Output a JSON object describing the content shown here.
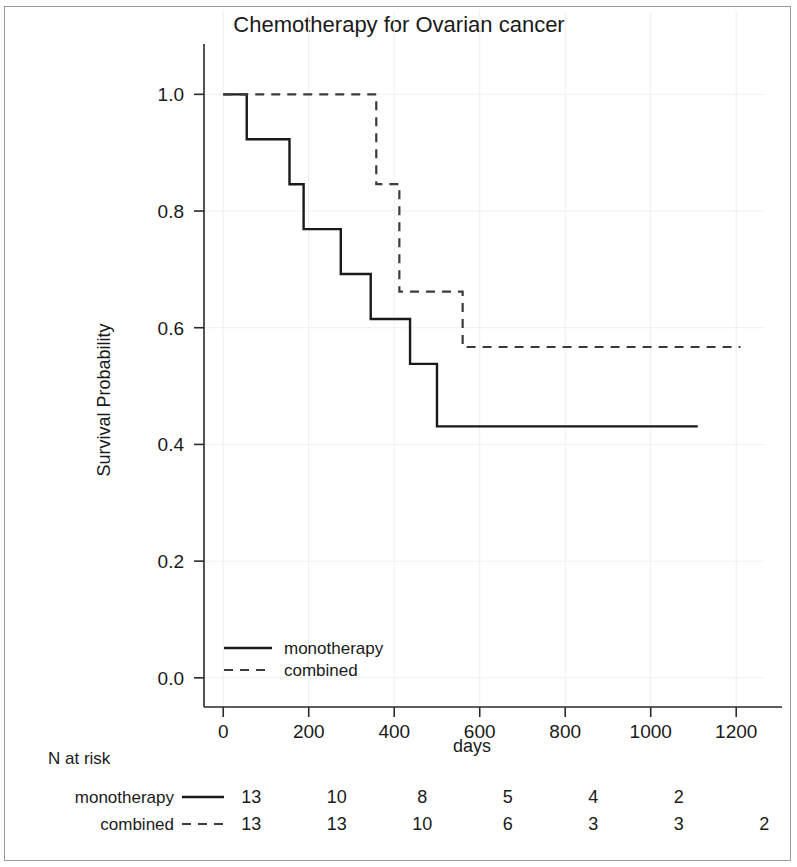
{
  "chart_data": {
    "type": "line",
    "title": "Chemotherapy for Ovarian cancer",
    "xlabel": "days",
    "ylabel": "Survival Probability",
    "xlim": [
      -45,
      1265
    ],
    "ylim": [
      -0.05,
      1.04
    ],
    "xticks": [
      0,
      200,
      400,
      600,
      800,
      1000,
      1200
    ],
    "xtick_labels": [
      "0",
      "200",
      "400",
      "600",
      "800",
      "1000",
      "1200"
    ],
    "yticks": [
      0.0,
      0.2,
      0.4,
      0.6,
      0.8,
      1.0
    ],
    "ytick_labels": [
      "0.0",
      "0.2",
      "0.4",
      "0.6",
      "0.8",
      "1.0"
    ],
    "grid": true,
    "legend_position": "lower left",
    "series": [
      {
        "name": "monotherapy",
        "style": "solid",
        "color": "#1a1a1a",
        "x": [
          0,
          55,
          55,
          155,
          155,
          188,
          188,
          275,
          275,
          345,
          345,
          437,
          437,
          500,
          500,
          1110
        ],
        "y": [
          1.0,
          1.0,
          0.923,
          0.923,
          0.846,
          0.846,
          0.769,
          0.769,
          0.692,
          0.692,
          0.615,
          0.615,
          0.538,
          0.538,
          0.431,
          0.431
        ],
        "steps": [
          {
            "time": 0,
            "survival": 1.0
          },
          {
            "time": 55,
            "survival": 0.923
          },
          {
            "time": 155,
            "survival": 0.846
          },
          {
            "time": 188,
            "survival": 0.769
          },
          {
            "time": 275,
            "survival": 0.692
          },
          {
            "time": 345,
            "survival": 0.615
          },
          {
            "time": 437,
            "survival": 0.538
          },
          {
            "time": 500,
            "survival": 0.431
          },
          {
            "time": 1110,
            "survival": 0.431
          }
        ]
      },
      {
        "name": "combined",
        "style": "dashed",
        "color": "#3c3c3c",
        "x": [
          0,
          358,
          358,
          412,
          412,
          462,
          462,
          560,
          560,
          1210
        ],
        "y": [
          1.0,
          1.0,
          0.846,
          0.846,
          0.662,
          0.662,
          0.662,
          0.662,
          0.567,
          0.567
        ],
        "steps": [
          {
            "time": 0,
            "survival": 1.0
          },
          {
            "time": 358,
            "survival": 0.846
          },
          {
            "time": 412,
            "survival": 0.662
          },
          {
            "time": 560,
            "survival": 0.567
          },
          {
            "time": 1210,
            "survival": 0.567
          }
        ]
      }
    ],
    "risk_table": {
      "heading": "N at risk",
      "times": [
        0,
        200,
        400,
        600,
        800,
        1000,
        1200
      ],
      "rows": [
        {
          "label": "monotherapy",
          "style": "solid",
          "counts": [
            "13",
            "10",
            "8",
            "5",
            "4",
            "2",
            ""
          ]
        },
        {
          "label": "combined",
          "style": "dashed",
          "counts": [
            "13",
            "13",
            "10",
            "6",
            "3",
            "3",
            "2"
          ]
        }
      ]
    }
  },
  "legend": {
    "items": [
      {
        "label": "monotherapy",
        "style": "solid"
      },
      {
        "label": "combined",
        "style": "dashed"
      }
    ]
  }
}
